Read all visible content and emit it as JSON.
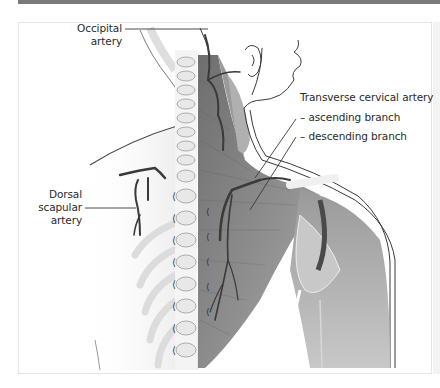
{
  "figure": {
    "labels": {
      "occipital": {
        "line1": "Occipital",
        "line2": "artery"
      },
      "transverse_cervical": "Transverse cervical artery",
      "ascending": "– ascending branch",
      "descending": "– descending branch",
      "dorsal_scapular": {
        "line1": "Dorsal",
        "line2": "scapular",
        "line3": "artery"
      }
    },
    "colors": {
      "artery": "#3a3a3a",
      "muscle": "#8a8a8a",
      "muscle_light": "#b5b5b5",
      "bone": "#eeeeee",
      "skin_outline": "#4a4a4a",
      "top_rule": "#7a7a7a"
    }
  }
}
